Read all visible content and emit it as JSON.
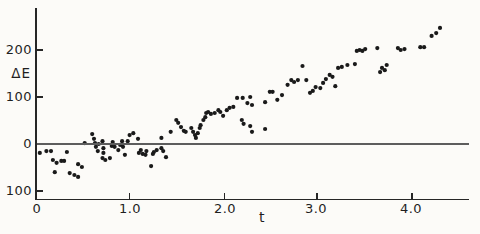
{
  "figure": {
    "background": "#fcfbf8",
    "ink": "#1a1a1a",
    "axis_color": "#262626",
    "zero_line_color": "#5d5d5d"
  },
  "y_axis": {
    "label": "ΔE",
    "ticks": [
      {
        "value": 200,
        "text": "200"
      },
      {
        "value": 100,
        "text": "100"
      },
      {
        "value": 0,
        "text": "0"
      },
      {
        "value": -100,
        "text": "100"
      }
    ]
  },
  "x_axis": {
    "label": "t",
    "ticks": [
      {
        "value": 0,
        "text": "0"
      },
      {
        "value": 1,
        "text": "1.0"
      },
      {
        "value": 2,
        "text": "2.0"
      },
      {
        "value": 3,
        "text": "3.0"
      },
      {
        "value": 4,
        "text": "4.0"
      }
    ]
  },
  "chart_data": {
    "type": "scatter",
    "title": "",
    "xlabel": "t",
    "ylabel": "ΔE",
    "xlim": [
      0,
      4.63
    ],
    "ylim": [
      -119,
      289
    ],
    "grid": false,
    "legend": null,
    "marker": {
      "shape": "dot",
      "radius_px": 2.1,
      "color": "#1a1a1a"
    },
    "x_tick_values": [
      0,
      1,
      2,
      3,
      4
    ],
    "y_tick_values": [
      200,
      100,
      0,
      -100
    ],
    "points": [
      [
        0.03,
        -19
      ],
      [
        0.1,
        -15
      ],
      [
        0.15,
        -15
      ],
      [
        0.17,
        -34
      ],
      [
        0.19,
        -60
      ],
      [
        0.21,
        -40
      ],
      [
        0.26,
        -36
      ],
      [
        0.29,
        -36
      ],
      [
        0.32,
        -17
      ],
      [
        0.35,
        -62
      ],
      [
        0.4,
        -66
      ],
      [
        0.44,
        -70
      ],
      [
        0.44,
        -43
      ],
      [
        0.48,
        -49
      ],
      [
        0.51,
        2
      ],
      [
        0.59,
        21
      ],
      [
        0.61,
        11
      ],
      [
        0.62,
        2
      ],
      [
        0.63,
        -6
      ],
      [
        0.65,
        -15
      ],
      [
        0.66,
        0
      ],
      [
        0.7,
        6
      ],
      [
        0.71,
        -9
      ],
      [
        0.71,
        -19
      ],
      [
        0.7,
        -30
      ],
      [
        0.73,
        -34
      ],
      [
        0.78,
        -30
      ],
      [
        0.8,
        -4
      ],
      [
        0.81,
        4
      ],
      [
        0.83,
        -6
      ],
      [
        0.87,
        -13
      ],
      [
        0.89,
        -2
      ],
      [
        0.91,
        6
      ],
      [
        0.92,
        -6
      ],
      [
        0.94,
        -23
      ],
      [
        0.97,
        6
      ],
      [
        0.99,
        19
      ],
      [
        1.03,
        23
      ],
      [
        1.08,
        11
      ],
      [
        1.09,
        -19
      ],
      [
        1.11,
        -13
      ],
      [
        1.13,
        -21
      ],
      [
        1.16,
        -23
      ],
      [
        1.17,
        -15
      ],
      [
        1.22,
        -47
      ],
      [
        1.24,
        -21
      ],
      [
        1.25,
        -17
      ],
      [
        1.28,
        -13
      ],
      [
        1.33,
        -9
      ],
      [
        1.35,
        -15
      ],
      [
        1.38,
        -28
      ],
      [
        1.33,
        13
      ],
      [
        1.43,
        26
      ],
      [
        1.49,
        51
      ],
      [
        1.51,
        45
      ],
      [
        1.54,
        36
      ],
      [
        1.57,
        28
      ],
      [
        1.59,
        26
      ],
      [
        1.65,
        34
      ],
      [
        1.67,
        26
      ],
      [
        1.69,
        19
      ],
      [
        1.7,
        13
      ],
      [
        1.72,
        23
      ],
      [
        1.74,
        34
      ],
      [
        1.75,
        40
      ],
      [
        1.78,
        51
      ],
      [
        1.8,
        57
      ],
      [
        1.81,
        66
      ],
      [
        1.83,
        68
      ],
      [
        1.86,
        64
      ],
      [
        1.9,
        66
      ],
      [
        1.94,
        72
      ],
      [
        1.96,
        68
      ],
      [
        1.99,
        60
      ],
      [
        2.03,
        72
      ],
      [
        2.06,
        77
      ],
      [
        2.1,
        79
      ],
      [
        2.14,
        98
      ],
      [
        2.2,
        98
      ],
      [
        2.25,
        87
      ],
      [
        2.28,
        100
      ],
      [
        2.3,
        83
      ],
      [
        2.44,
        89
      ],
      [
        2.49,
        111
      ],
      [
        2.52,
        111
      ],
      [
        2.57,
        94
      ],
      [
        2.62,
        104
      ],
      [
        2.19,
        51
      ],
      [
        2.21,
        43
      ],
      [
        2.28,
        38
      ],
      [
        2.3,
        26
      ],
      [
        2.44,
        32
      ],
      [
        2.68,
        126
      ],
      [
        2.72,
        136
      ],
      [
        2.75,
        132
      ],
      [
        2.79,
        136
      ],
      [
        2.84,
        166
      ],
      [
        2.88,
        136
      ],
      [
        2.92,
        109
      ],
      [
        2.95,
        113
      ],
      [
        2.98,
        121
      ],
      [
        3.03,
        119
      ],
      [
        3.06,
        130
      ],
      [
        3.09,
        138
      ],
      [
        3.13,
        147
      ],
      [
        3.16,
        143
      ],
      [
        3.19,
        123
      ],
      [
        3.22,
        162
      ],
      [
        3.26,
        164
      ],
      [
        3.32,
        168
      ],
      [
        3.4,
        170
      ],
      [
        3.42,
        198
      ],
      [
        3.45,
        200
      ],
      [
        3.48,
        198
      ],
      [
        3.51,
        202
      ],
      [
        3.64,
        204
      ],
      [
        3.67,
        153
      ],
      [
        3.69,
        162
      ],
      [
        3.72,
        157
      ],
      [
        3.74,
        168
      ],
      [
        3.86,
        204
      ],
      [
        3.89,
        200
      ],
      [
        3.93,
        202
      ],
      [
        4.1,
        206
      ],
      [
        4.14,
        206
      ],
      [
        4.22,
        230
      ],
      [
        4.27,
        236
      ],
      [
        4.31,
        247
      ]
    ]
  }
}
